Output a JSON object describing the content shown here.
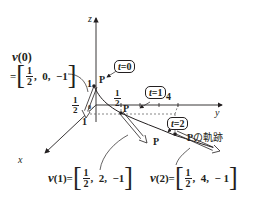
{
  "axes": {
    "x_label": "x",
    "y_label": "y",
    "z_label": "z"
  },
  "ticks": {
    "z_one": "1",
    "x_one": "1",
    "y_one": "1",
    "y_four": "4",
    "half_num": "1",
    "half_den": "2",
    "origin_mark": "0"
  },
  "time_labels": {
    "t0": {
      "var": "t",
      "eq": "=0"
    },
    "t1": {
      "var": "t",
      "eq": "=1"
    },
    "t2": {
      "var": "t",
      "eq": "=2"
    }
  },
  "point_label": "P",
  "trajectory_label": {
    "point": "P",
    "text": "の軌跡"
  },
  "vectors": {
    "v0": {
      "name": "v",
      "arg": "(0)",
      "eq": "=",
      "num": "1",
      "den": "2",
      "rest": ",  0,  −1"
    },
    "v1": {
      "name": "v",
      "arg": "(1)",
      "eq": "=",
      "num": "1",
      "den": "2",
      "rest": ",  2,  −1"
    },
    "v2": {
      "name": "v",
      "arg": "(2)",
      "eq": "=",
      "num": "1",
      "den": "2",
      "rest": ",  4,  − 1"
    }
  },
  "colors": {
    "ink": "#231f20",
    "dash": "#555555"
  }
}
